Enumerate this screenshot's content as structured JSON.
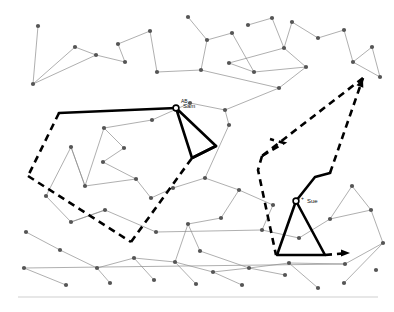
{
  "figure": {
    "background_color": "#ffffff",
    "network_edge_color": "#8c8c8c",
    "network_node_color": "#555555",
    "trajectory_color": "#000000",
    "rule_color": "#cfcfcf",
    "width": 394,
    "height": 312
  },
  "agents": [
    {
      "id": "sam",
      "label": "Sam",
      "glyph": "AB",
      "marker_x": 176,
      "marker_y": 108,
      "label_x": 183,
      "label_y": 108,
      "glyph_x": 181,
      "glyph_y": 103
    },
    {
      "id": "sue",
      "label": "Sue",
      "glyph": "+",
      "marker_x": 296,
      "marker_y": 201,
      "label_x": 307,
      "label_y": 203,
      "glyph_x": 301,
      "glyph_y": 200
    }
  ],
  "trajectories": [
    {
      "id": "sam-route",
      "agent": "Sam",
      "solid_segments": [
        "M 59,113 L 176,108",
        "M 176,108 L 216,146 L 192,158 L 176,108",
        "M 192,158 L 216,146"
      ],
      "dashed_segments": [
        "M 59,113 L 28,176",
        "M 28,176 L 131,242",
        "M 131,242 L 192,158"
      ],
      "arrowheads": []
    },
    {
      "id": "sue-route",
      "agent": "Sue",
      "solid_segments": [
        "M 296,201 L 315,177 L 330,173",
        "M 296,201 L 277,255 L 325,255 L 296,201"
      ],
      "dashed_segments": [
        "M 330,173 L 363,78",
        "M 363,78 L 262,156",
        "M 262,156 L 284,143 L 270,139",
        "M 262,156 L 258,170 L 276,255",
        "M 325,255 L 348,253"
      ],
      "arrowheads": [
        {
          "x": 363,
          "y": 78,
          "angle": -70
        },
        {
          "x": 350,
          "y": 253,
          "angle": 0
        }
      ]
    }
  ],
  "network": {
    "nodes": [
      [
        38,
        26
      ],
      [
        75,
        47
      ],
      [
        33,
        84
      ],
      [
        96,
        55
      ],
      [
        118,
        44
      ],
      [
        150,
        31
      ],
      [
        125,
        62
      ],
      [
        157,
        72
      ],
      [
        188,
        17
      ],
      [
        207,
        40
      ],
      [
        232,
        33
      ],
      [
        201,
        70
      ],
      [
        229,
        63
      ],
      [
        254,
        72
      ],
      [
        248,
        25
      ],
      [
        272,
        18
      ],
      [
        284,
        48
      ],
      [
        292,
        22
      ],
      [
        318,
        38
      ],
      [
        344,
        30
      ],
      [
        353,
        62
      ],
      [
        372,
        47
      ],
      [
        380,
        77
      ],
      [
        306,
        67
      ],
      [
        279,
        88
      ],
      [
        225,
        110
      ],
      [
        229,
        125
      ],
      [
        190,
        103
      ],
      [
        152,
        120
      ],
      [
        104,
        128
      ],
      [
        71,
        147
      ],
      [
        103,
        162
      ],
      [
        124,
        148
      ],
      [
        136,
        179
      ],
      [
        85,
        186
      ],
      [
        46,
        196
      ],
      [
        71,
        222
      ],
      [
        105,
        210
      ],
      [
        151,
        198
      ],
      [
        156,
        232
      ],
      [
        173,
        188
      ],
      [
        205,
        178
      ],
      [
        239,
        190
      ],
      [
        221,
        218
      ],
      [
        188,
        224
      ],
      [
        200,
        251
      ],
      [
        262,
        230
      ],
      [
        273,
        205
      ],
      [
        299,
        238
      ],
      [
        330,
        219
      ],
      [
        352,
        186
      ],
      [
        371,
        210
      ],
      [
        383,
        243
      ],
      [
        345,
        264
      ],
      [
        289,
        263
      ],
      [
        249,
        268
      ],
      [
        213,
        272
      ],
      [
        175,
        262
      ],
      [
        134,
        258
      ],
      [
        97,
        268
      ],
      [
        60,
        250
      ],
      [
        26,
        232
      ],
      [
        24,
        268
      ],
      [
        318,
        288
      ],
      [
        285,
        275
      ],
      [
        242,
        285
      ],
      [
        196,
        284
      ],
      [
        154,
        280
      ],
      [
        110,
        283
      ],
      [
        66,
        285
      ],
      [
        344,
        283
      ],
      [
        376,
        270
      ]
    ],
    "edges": [
      [
        0,
        2
      ],
      [
        2,
        1
      ],
      [
        1,
        3
      ],
      [
        3,
        6
      ],
      [
        6,
        4
      ],
      [
        4,
        5
      ],
      [
        5,
        7
      ],
      [
        7,
        11
      ],
      [
        11,
        9
      ],
      [
        9,
        10
      ],
      [
        10,
        13
      ],
      [
        13,
        12
      ],
      [
        12,
        16
      ],
      [
        16,
        17
      ],
      [
        8,
        9
      ],
      [
        14,
        15
      ],
      [
        15,
        16
      ],
      [
        17,
        18
      ],
      [
        18,
        19
      ],
      [
        19,
        20
      ],
      [
        20,
        21
      ],
      [
        21,
        22
      ],
      [
        23,
        16
      ],
      [
        23,
        24
      ],
      [
        24,
        25
      ],
      [
        25,
        26
      ],
      [
        26,
        41
      ],
      [
        27,
        28
      ],
      [
        28,
        29
      ],
      [
        29,
        32
      ],
      [
        32,
        31
      ],
      [
        31,
        33
      ],
      [
        33,
        38
      ],
      [
        38,
        40
      ],
      [
        40,
        41
      ],
      [
        41,
        42
      ],
      [
        42,
        43
      ],
      [
        43,
        44
      ],
      [
        44,
        45
      ],
      [
        34,
        30
      ],
      [
        30,
        35
      ],
      [
        35,
        36
      ],
      [
        36,
        37
      ],
      [
        37,
        39
      ],
      [
        39,
        46
      ],
      [
        46,
        47
      ],
      [
        47,
        42
      ],
      [
        48,
        49
      ],
      [
        49,
        50
      ],
      [
        50,
        51
      ],
      [
        51,
        52
      ],
      [
        46,
        48
      ],
      [
        53,
        52
      ],
      [
        53,
        54
      ],
      [
        54,
        55
      ],
      [
        55,
        56
      ],
      [
        56,
        57
      ],
      [
        57,
        58
      ],
      [
        58,
        59
      ],
      [
        59,
        60
      ],
      [
        60,
        61
      ],
      [
        62,
        53
      ],
      [
        63,
        54
      ],
      [
        64,
        55
      ],
      [
        65,
        56
      ],
      [
        66,
        57
      ],
      [
        67,
        58
      ],
      [
        68,
        59
      ],
      [
        69,
        62
      ],
      [
        70,
        52
      ],
      [
        34,
        29
      ],
      [
        30,
        34
      ],
      [
        3,
        2
      ],
      [
        13,
        23
      ],
      [
        25,
        27
      ],
      [
        33,
        34
      ],
      [
        44,
        57
      ],
      [
        45,
        55
      ],
      [
        49,
        51
      ],
      [
        20,
        22
      ],
      [
        11,
        24
      ],
      [
        37,
        36
      ]
    ]
  },
  "baseline_rule": {
    "x1": 18,
    "y1": 297,
    "x2": 378,
    "y2": 297
  }
}
